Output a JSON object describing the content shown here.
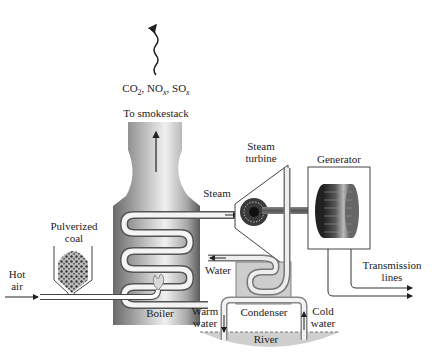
{
  "diagram": {
    "emissions": {
      "label_parts": [
        {
          "base": "CO",
          "sub": "2",
          "sep": ", "
        },
        {
          "base": "NO",
          "sub": "x",
          "sep": ", "
        },
        {
          "base": "SO",
          "sub": "x",
          "sep": ""
        }
      ]
    },
    "labels": {
      "smokestack": "To smokestack",
      "steam_turbine_line1": "Steam",
      "steam_turbine_line2": "turbine",
      "generator": "Generator",
      "steam": "Steam",
      "pulverized_line1": "Pulverized",
      "pulverized_line2": "coal",
      "hot_air_line1": "Hot",
      "hot_air_line2": "air",
      "water": "Water",
      "transmission_line1": "Transmission",
      "transmission_line2": "lines",
      "boiler": "Boiler",
      "warm_water_line1": "Warm",
      "warm_water_line2": "water",
      "condenser": "Condenser",
      "cold_water_line1": "Cold",
      "cold_water_line2": "water",
      "river": "River"
    },
    "colors": {
      "boiler_dark": "#6e6e6e",
      "boiler_light": "#e6e6e6",
      "line": "#333333",
      "river": "#c8c8c8",
      "condenser": "#cfcfcf"
    }
  }
}
